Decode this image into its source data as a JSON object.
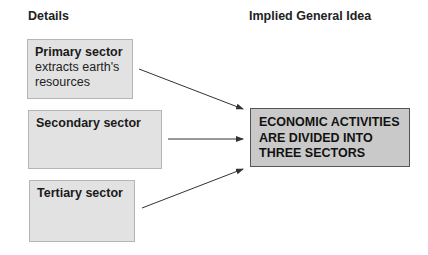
{
  "headings": {
    "details": "Details",
    "implied": "Implied General Idea"
  },
  "details": [
    {
      "title": "Primary sector",
      "line1": "extracts earth's",
      "line2": "resources"
    },
    {
      "title": "Secondary sector"
    },
    {
      "title": "Tertiary sector"
    }
  ],
  "main_idea": {
    "line1": "ECONOMIC ACTIVITIES",
    "line2": "ARE DIVIDED INTO",
    "line3": "THREE SECTORS"
  },
  "colors": {
    "detail_box": "#e2e2e2",
    "main_box": "#c9c9c9",
    "arrow": "#333333"
  }
}
